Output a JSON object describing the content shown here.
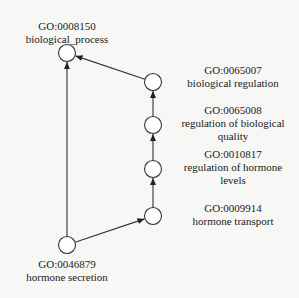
{
  "diagram": {
    "type": "GO term hierarchy",
    "nodes": [
      {
        "id": "GO:0008150",
        "name": "biological_process"
      },
      {
        "id": "GO:0065007",
        "name": "biological regulation"
      },
      {
        "id": "GO:0065008",
        "name": "regulation of biological",
        "name2": "quality"
      },
      {
        "id": "GO:0010817",
        "name": "regulation of hormone",
        "name2": "levels"
      },
      {
        "id": "GO:0009914",
        "name": "hormone transport"
      },
      {
        "id": "GO:0046879",
        "name": "hormone secretion"
      }
    ],
    "edges": [
      {
        "from": "GO:0046879",
        "to": "GO:0008150"
      },
      {
        "from": "GO:0046879",
        "to": "GO:0009914"
      },
      {
        "from": "GO:0009914",
        "to": "GO:0010817"
      },
      {
        "from": "GO:0010817",
        "to": "GO:0065008"
      },
      {
        "from": "GO:0065008",
        "to": "GO:0065007"
      },
      {
        "from": "GO:0065007",
        "to": "GO:0008150"
      }
    ]
  }
}
